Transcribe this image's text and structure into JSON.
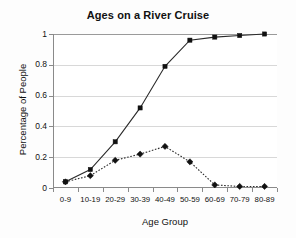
{
  "chart_data": {
    "type": "line",
    "title": "Ages on a River Cruise",
    "xlabel": "Age Group",
    "ylabel": "Percentage of People",
    "categories": [
      "0-9",
      "10-19",
      "20-29",
      "30-39",
      "40-49",
      "50-59",
      "60-69",
      "70-79",
      "80-89"
    ],
    "series": [
      {
        "name": "Cumulative percentage",
        "marker": "square",
        "line_style": "solid",
        "color": "#111111",
        "values": [
          0.04,
          0.12,
          0.3,
          0.52,
          0.79,
          0.96,
          0.98,
          0.99,
          1.0
        ]
      },
      {
        "name": "Percentage per age group",
        "marker": "diamond",
        "line_style": "dotted",
        "color": "#111111",
        "values": [
          0.04,
          0.08,
          0.18,
          0.22,
          0.27,
          0.17,
          0.02,
          0.01,
          0.01
        ]
      }
    ],
    "ylim": [
      0,
      1
    ],
    "ytick_labels": [
      "0",
      "0.2",
      "0.4",
      "0.6",
      "0.8",
      "1"
    ],
    "ytick_values": [
      0,
      0.2,
      0.4,
      0.6,
      0.8,
      1
    ],
    "grid": true,
    "grid_axis": "y",
    "legend": false,
    "legend_position": "none",
    "background_color": "#ffffff",
    "axis_color": "#8a8a8a",
    "grid_color": "#d8d8d8"
  }
}
